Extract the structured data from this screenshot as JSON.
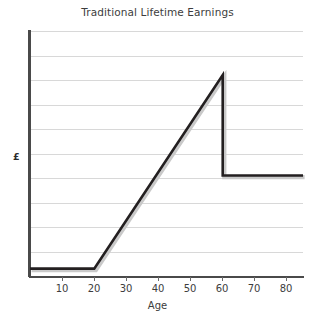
{
  "chart_data": {
    "type": "line",
    "title": "Traditional Lifetime Earnings",
    "xlabel": "Age",
    "ylabel": "£",
    "xlim": [
      0,
      85
    ],
    "ylim": [
      0,
      100
    ],
    "grid": true,
    "gridlines_count": 10,
    "legend": null,
    "legend_position": "none",
    "x_ticks": [
      10,
      20,
      30,
      40,
      50,
      60,
      70,
      80
    ],
    "x_tick_labels": [
      "10",
      "20",
      "30",
      "40",
      "50",
      "60",
      "70",
      "80"
    ],
    "y_ticks": [],
    "y_tick_labels": [],
    "series": [
      {
        "name": "Traditional Lifetime Earnings",
        "color": "#231f20",
        "x": [
          0,
          20,
          60,
          60,
          85
        ],
        "values": [
          3,
          3,
          82,
          41,
          41
        ]
      }
    ],
    "annotations": [
      {
        "label": "flat pre-career earnings",
        "x_range": [
          0,
          20
        ],
        "y": 3
      },
      {
        "label": "linear earnings growth",
        "x_range": [
          20,
          60
        ],
        "y_range": [
          3,
          82
        ]
      },
      {
        "label": "peak earnings at retirement age",
        "x": 60,
        "y": 82
      },
      {
        "label": "retirement income drop",
        "x": 60,
        "y_range": [
          82,
          41
        ]
      },
      {
        "label": "flat retirement income",
        "x_range": [
          60,
          85
        ],
        "y": 41
      }
    ]
  },
  "figure": {
    "background_color": "#ffffff",
    "axis_color": "#4a4a4a",
    "grid_color": "#d8d8d8",
    "text_color": "#3d3d3d",
    "series_color": "#231f20"
  }
}
